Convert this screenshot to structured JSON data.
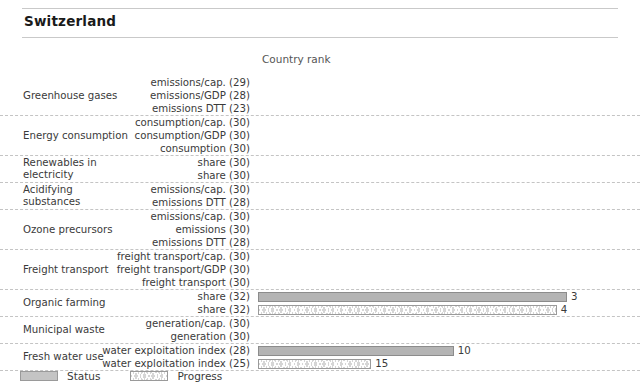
{
  "header": {
    "title": "Switzerland"
  },
  "column_header": {
    "label": "Country rank"
  },
  "legend": {
    "status_label": "Status",
    "progress_label": "Progress"
  },
  "colors": {
    "status_fill": "#b4b4b4",
    "status_border": "#8c8c8c",
    "progress_fill": "#d6d6d6",
    "progress_border": "#9a9a9a",
    "rule": "#c9c9c9",
    "separator": "#c4c4c4",
    "text": "#3a3a3a"
  },
  "chart_data": {
    "type": "bar",
    "title": "Switzerland",
    "xlabel": "Country rank",
    "ylabel": "",
    "orientation": "horizontal",
    "axis_max": 32,
    "grid": false,
    "legend_position": "bottom-left",
    "series": [
      {
        "name": "Status",
        "style": "solid"
      },
      {
        "name": "Progress",
        "style": "chevron-hatched"
      }
    ],
    "groups": [
      {
        "name": "Greenhouse gases",
        "rows": [
          {
            "label": "emissions/cap. (29)",
            "rank_total": 29,
            "status": null,
            "progress": null
          },
          {
            "label": "emissions/GDP (28)",
            "rank_total": 28,
            "status": null,
            "progress": null
          },
          {
            "label": "emissions DTT (23)",
            "rank_total": 23,
            "status": null,
            "progress": null
          }
        ]
      },
      {
        "name": "Energy consumption",
        "rows": [
          {
            "label": "consumption/cap. (30)",
            "rank_total": 30,
            "status": null,
            "progress": null
          },
          {
            "label": "consumption/GDP (30)",
            "rank_total": 30,
            "status": null,
            "progress": null
          },
          {
            "label": "consumption (30)",
            "rank_total": 30,
            "status": null,
            "progress": null
          }
        ]
      },
      {
        "name": "Renewables in electricity",
        "rows": [
          {
            "label": "share (30)",
            "rank_total": 30,
            "status": null,
            "progress": null
          },
          {
            "label": "share (30)",
            "rank_total": 30,
            "status": null,
            "progress": null
          }
        ]
      },
      {
        "name": "Acidifying substances",
        "rows": [
          {
            "label": "emissions/cap. (30)",
            "rank_total": 30,
            "status": null,
            "progress": null
          },
          {
            "label": "emissions DTT (28)",
            "rank_total": 28,
            "status": null,
            "progress": null
          }
        ]
      },
      {
        "name": "Ozone precursors",
        "rows": [
          {
            "label": "emissions/cap. (30)",
            "rank_total": 30,
            "status": null,
            "progress": null
          },
          {
            "label": "emissions (30)",
            "rank_total": 30,
            "status": null,
            "progress": null
          },
          {
            "label": "emissions DTT (28)",
            "rank_total": 28,
            "status": null,
            "progress": null
          }
        ]
      },
      {
        "name": "Freight transport",
        "rows": [
          {
            "label": "freight transport/cap. (30)",
            "rank_total": 30,
            "status": null,
            "progress": null
          },
          {
            "label": "freight transport/GDP (30)",
            "rank_total": 30,
            "status": null,
            "progress": null
          },
          {
            "label": "freight transport (30)",
            "rank_total": 30,
            "status": null,
            "progress": null
          }
        ]
      },
      {
        "name": "Organic farming",
        "rows": [
          {
            "label": "share (32)",
            "rank_total": 32,
            "status": 3,
            "progress": null,
            "value_text": "3"
          },
          {
            "label": "share (32)",
            "rank_total": 32,
            "status": null,
            "progress": 4,
            "value_text": "4"
          }
        ]
      },
      {
        "name": "Municipal waste",
        "rows": [
          {
            "label": "generation/cap. (30)",
            "rank_total": 30,
            "status": null,
            "progress": null
          },
          {
            "label": "generation (30)",
            "rank_total": 30,
            "status": null,
            "progress": null
          }
        ]
      },
      {
        "name": "Fresh water use",
        "rows": [
          {
            "label": "water exploitation index (28)",
            "rank_total": 28,
            "status": 10,
            "progress": null,
            "value_text": "10"
          },
          {
            "label": "water exploitation index (25)",
            "rank_total": 25,
            "status": null,
            "progress": 15,
            "value_text": "15"
          }
        ]
      }
    ]
  }
}
